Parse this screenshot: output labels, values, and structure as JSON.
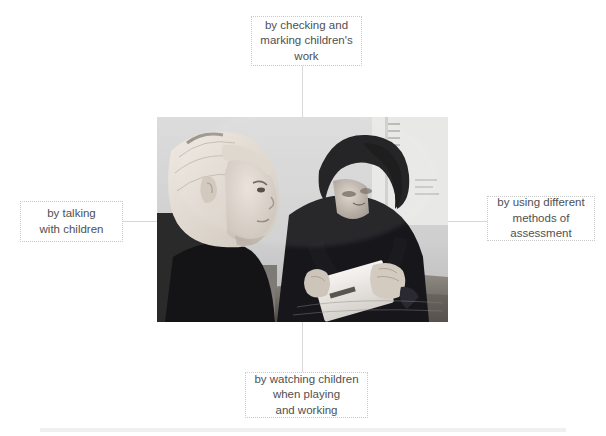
{
  "diagram": {
    "type": "central-image-with-four-labels",
    "center": {
      "image_alt": "black and white photograph of a teacher sitting at a table with a young child, holding a flashcard",
      "image_style": "grayscale photograph"
    },
    "nodes": [
      {
        "id": "top",
        "position": "top",
        "text": "by checking and\nmarking children's\nwork"
      },
      {
        "id": "left",
        "position": "left",
        "text": "by talking\nwith children"
      },
      {
        "id": "right",
        "position": "right",
        "text": "by using different\nmethods of\nassessment"
      },
      {
        "id": "bottom",
        "position": "bottom",
        "text": "by watching children\nwhen playing\nand working"
      }
    ],
    "colors": {
      "background": "#ffffff",
      "text": "#4f4f52",
      "box_border": "#c9c9c9",
      "connector": "#d8d8d8",
      "divider": "#f0f0f0"
    }
  }
}
